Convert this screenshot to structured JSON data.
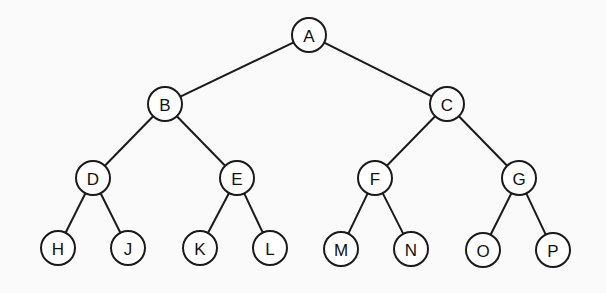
{
  "diagram": {
    "type": "binary-tree",
    "node_radius": 17,
    "nodes": [
      {
        "id": "A",
        "label": "A",
        "x": 309,
        "y": 35
      },
      {
        "id": "B",
        "label": "B",
        "x": 165,
        "y": 104
      },
      {
        "id": "C",
        "label": "C",
        "x": 447,
        "y": 104
      },
      {
        "id": "D",
        "label": "D",
        "x": 93,
        "y": 178
      },
      {
        "id": "E",
        "label": "E",
        "x": 237,
        "y": 178
      },
      {
        "id": "F",
        "label": "F",
        "x": 375,
        "y": 178
      },
      {
        "id": "G",
        "label": "G",
        "x": 519,
        "y": 178
      },
      {
        "id": "H",
        "label": "H",
        "x": 58,
        "y": 248
      },
      {
        "id": "J",
        "label": "J",
        "x": 128,
        "y": 248
      },
      {
        "id": "K",
        "label": "K",
        "x": 200,
        "y": 248
      },
      {
        "id": "L",
        "label": "L",
        "x": 270,
        "y": 248
      },
      {
        "id": "M",
        "label": "M",
        "x": 341,
        "y": 249
      },
      {
        "id": "N",
        "label": "N",
        "x": 411,
        "y": 249
      },
      {
        "id": "O",
        "label": "O",
        "x": 483,
        "y": 250
      },
      {
        "id": "P",
        "label": "P",
        "x": 553,
        "y": 250
      }
    ],
    "edges": [
      [
        "A",
        "B"
      ],
      [
        "A",
        "C"
      ],
      [
        "B",
        "D"
      ],
      [
        "B",
        "E"
      ],
      [
        "C",
        "F"
      ],
      [
        "C",
        "G"
      ],
      [
        "D",
        "H"
      ],
      [
        "D",
        "J"
      ],
      [
        "E",
        "K"
      ],
      [
        "E",
        "L"
      ],
      [
        "F",
        "M"
      ],
      [
        "F",
        "N"
      ],
      [
        "G",
        "O"
      ],
      [
        "G",
        "P"
      ]
    ]
  }
}
